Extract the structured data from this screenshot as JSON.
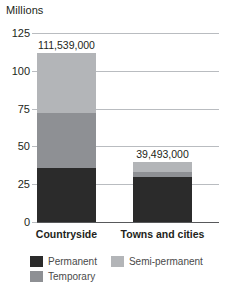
{
  "chart_data": {
    "type": "bar",
    "subtype": "stacked-vertical",
    "title": "",
    "ylabel": "Millions",
    "xlabel": "",
    "ylim": [
      0,
      125
    ],
    "yticks": [
      0,
      25,
      50,
      75,
      100,
      125
    ],
    "ytick_labels": [
      "0",
      "25",
      "50",
      "75",
      "100",
      "125"
    ],
    "grid": true,
    "legend_position": "bottom",
    "categories": [
      "Countryside",
      "Towns and cities"
    ],
    "series": [
      {
        "name": "Permanent",
        "color": "#2b2b2b",
        "values": [
          36.0,
          30.0
        ]
      },
      {
        "name": "Temporary",
        "color": "#8e9094",
        "values": [
          36.0,
          3.2
        ]
      },
      {
        "name": "Semi-permanent",
        "color": "#b3b5b8",
        "values": [
          39.5,
          6.3
        ]
      }
    ],
    "totals": [
      111.539,
      39.493
    ],
    "total_labels": [
      "111,539,000",
      "39,493,000"
    ],
    "units": "millions"
  },
  "axis": {
    "y_title": "Millions"
  },
  "colors": {
    "permanent": "#2b2b2b",
    "temporary": "#8e9094",
    "semi_permanent": "#b3b5b8",
    "gridline": "#b9bcc0",
    "baseline": "#58595b",
    "text": "#231f20",
    "legend_text": "#4a4a4a"
  }
}
